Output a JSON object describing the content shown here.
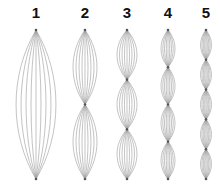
{
  "diagram": {
    "line_color": "#9a9a9a",
    "node_color": "#555555",
    "top_y": 30,
    "bottom_y": 179,
    "lines_per_lobe": 9,
    "columns": [
      {
        "label": "1",
        "cx": 36,
        "lobes": 1,
        "half_width": 20
      },
      {
        "label": "2",
        "cx": 85,
        "lobes": 2,
        "half_width": 12
      },
      {
        "label": "3",
        "cx": 127,
        "lobes": 3,
        "half_width": 10
      },
      {
        "label": "4",
        "cx": 168,
        "lobes": 4,
        "half_width": 7
      },
      {
        "label": "5",
        "cx": 206,
        "lobes": 5,
        "half_width": 5.5
      }
    ]
  }
}
